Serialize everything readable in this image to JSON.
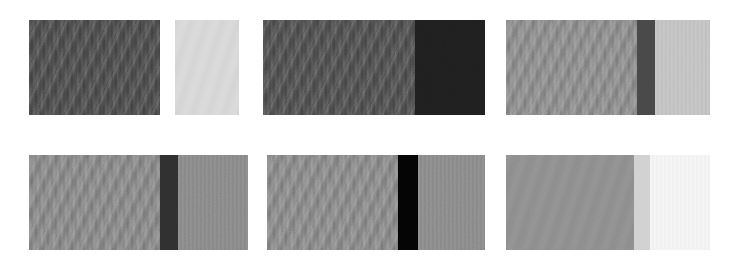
{
  "figure": {
    "background_color": "#ffffff",
    "width": 734,
    "height": 270,
    "rows": 2,
    "columns": 3,
    "panel_count": 6
  },
  "panels": [
    {
      "id": "panel-1",
      "position": "row-1-col-1",
      "x": 29,
      "y": 20,
      "width": 210,
      "height": 95,
      "regions": [
        {
          "name": "dark-textured-sample",
          "label": "dark weave",
          "color": "#4a4a4a",
          "width_px": 131,
          "texture": "diagonal-weave",
          "grain": "high"
        },
        {
          "name": "inter-sample-gap",
          "label": "gap",
          "color": "#ffffff",
          "width_px": 15,
          "texture": "none",
          "grain": "none"
        },
        {
          "name": "light-textured-sample",
          "label": "light weave",
          "color": "#d9d9d9",
          "width_px": 64,
          "texture": "smooth-weave",
          "grain": "low"
        }
      ]
    },
    {
      "id": "panel-2",
      "position": "row-1-col-2",
      "x": 263,
      "y": 20,
      "width": 222,
      "height": 95,
      "regions": [
        {
          "name": "dark-textured-sample",
          "label": "dark weave",
          "color": "#4d4d4d",
          "width_px": 152,
          "texture": "diagonal-weave",
          "grain": "high"
        },
        {
          "name": "near-black-sample",
          "label": "near black",
          "color": "#1e1e1e",
          "width_px": 70,
          "texture": "fine-grain",
          "grain": "high"
        }
      ]
    },
    {
      "id": "panel-3",
      "position": "row-1-col-3",
      "x": 506,
      "y": 20,
      "width": 204,
      "height": 95,
      "regions": [
        {
          "name": "medium-gray-textured-sample",
          "label": "medium gray weave",
          "color": "#8f8f8f",
          "width_px": 131,
          "texture": "diagonal-weave",
          "grain": "medium"
        },
        {
          "name": "dark-band",
          "label": "dark band",
          "color": "#474747",
          "width_px": 18,
          "texture": "fine-grain",
          "grain": "medium"
        },
        {
          "name": "light-gray-sample",
          "label": "light gray",
          "color": "#c4c4c4",
          "width_px": 55,
          "texture": "vertical-striation",
          "grain": "low"
        }
      ]
    },
    {
      "id": "panel-4",
      "position": "row-2-col-1",
      "x": 29,
      "y": 155,
      "width": 219,
      "height": 95,
      "regions": [
        {
          "name": "medium-gray-textured-sample",
          "label": "medium gray weave",
          "color": "#8a8a8a",
          "width_px": 131,
          "texture": "diagonal-weave",
          "grain": "medium"
        },
        {
          "name": "dark-band",
          "label": "dark band",
          "color": "#2e2e2e",
          "width_px": 18,
          "texture": "fine-grain",
          "grain": "high"
        },
        {
          "name": "medium-gray-striated-sample",
          "label": "medium gray striated",
          "color": "#898989",
          "width_px": 70,
          "texture": "vertical-striation",
          "grain": "medium"
        }
      ]
    },
    {
      "id": "panel-5",
      "position": "row-2-col-2",
      "x": 267,
      "y": 155,
      "width": 218,
      "height": 95,
      "regions": [
        {
          "name": "medium-gray-textured-sample",
          "label": "medium gray weave",
          "color": "#8c8c8c",
          "width_px": 131,
          "texture": "diagonal-weave",
          "grain": "medium"
        },
        {
          "name": "black-band",
          "label": "black band",
          "color": "#050505",
          "width_px": 20,
          "texture": "none",
          "grain": "none"
        },
        {
          "name": "medium-gray-striated-sample",
          "label": "medium gray striated",
          "color": "#8a8a8a",
          "width_px": 67,
          "texture": "vertical-striation",
          "grain": "medium"
        }
      ]
    },
    {
      "id": "panel-6",
      "position": "row-2-col-3",
      "x": 506,
      "y": 155,
      "width": 204,
      "height": 95,
      "regions": [
        {
          "name": "medium-gray-smooth-sample",
          "label": "medium gray smooth",
          "color": "#909090",
          "width_px": 128,
          "texture": "smooth-weave",
          "grain": "low"
        },
        {
          "name": "light-gray-transition",
          "label": "light gray transition",
          "color": "#d2d2d2",
          "width_px": 16,
          "texture": "none",
          "grain": "none"
        },
        {
          "name": "near-white-sample",
          "label": "near white",
          "color": "#f5f5f5",
          "width_px": 60,
          "texture": "vertical-striation",
          "grain": "low"
        }
      ]
    }
  ]
}
